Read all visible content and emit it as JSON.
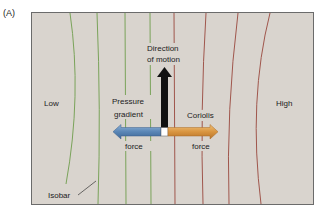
{
  "panel_label": "(A)",
  "labels": {
    "low": "Low",
    "high": "High",
    "isobar": "Isobar",
    "motion_line1": "Direction",
    "motion_line2": "of motion",
    "pgf_line1": "Pressure",
    "pgf_line2": "gradient",
    "pgf_line3": "force",
    "coriolis_line1": "Coriolis",
    "coriolis_line2": "force"
  },
  "colors": {
    "background": "#d9d4ce",
    "frame": "#6b6b6b",
    "isobar_low": "#7aa35a",
    "isobar_high": "#a0564c",
    "motion_arrow": "#111111",
    "pgf_arrow": "#5f88b6",
    "coriolis_arrow": "#d9953f"
  },
  "isobars": {
    "low_side_count": 4,
    "high_side_count": 4
  }
}
